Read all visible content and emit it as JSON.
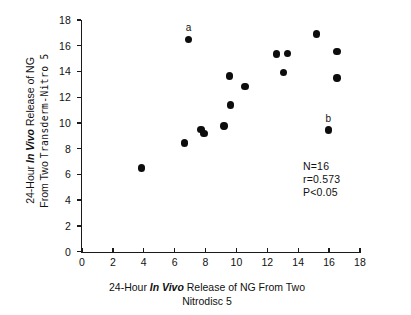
{
  "chart_data": {
    "type": "scatter",
    "title": "",
    "xlabel_line1_pre": "24-Hour ",
    "xlabel_line1_em": "In Vivo",
    "xlabel_line1_post": " Release of NG From Two",
    "xlabel_line2": "Nitrodisc 5",
    "ylabel_line1_pre": "24-Hour ",
    "ylabel_line1_em": "In Vivo",
    "ylabel_line1_post": " Release of NG",
    "ylabel_line2_pre": "From Two ",
    "ylabel_line2_mono": "Transderm-Nitro 5",
    "xlim": [
      0,
      18
    ],
    "ylim": [
      0,
      18
    ],
    "xticks": [
      0,
      2,
      4,
      6,
      8,
      10,
      12,
      14,
      16,
      18
    ],
    "yticks": [
      0,
      2,
      4,
      6,
      8,
      10,
      12,
      14,
      16,
      18
    ],
    "xtick_labels": [
      "0",
      "2",
      "4",
      "6",
      "8",
      "10",
      "12",
      "14",
      "16",
      "18"
    ],
    "ytick_labels": [
      "0",
      "2",
      "4",
      "6",
      "8",
      "10",
      "12",
      "14",
      "16",
      "18"
    ],
    "grid": false,
    "legend": false,
    "marker": "filled-circle",
    "marker_color": "#0d0d0d",
    "points": [
      {
        "x": 3.85,
        "y": 6.5,
        "label": ""
      },
      {
        "x": 6.65,
        "y": 8.45,
        "label": ""
      },
      {
        "x": 6.9,
        "y": 16.5,
        "label": "a"
      },
      {
        "x": 7.7,
        "y": 9.5,
        "label": ""
      },
      {
        "x": 7.9,
        "y": 9.2,
        "label": ""
      },
      {
        "x": 9.2,
        "y": 9.75,
        "label": ""
      },
      {
        "x": 9.55,
        "y": 13.65,
        "label": ""
      },
      {
        "x": 9.6,
        "y": 11.4,
        "label": ""
      },
      {
        "x": 10.55,
        "y": 12.85,
        "label": ""
      },
      {
        "x": 12.6,
        "y": 15.35,
        "label": ""
      },
      {
        "x": 13.05,
        "y": 13.9,
        "label": ""
      },
      {
        "x": 13.3,
        "y": 15.4,
        "label": ""
      },
      {
        "x": 15.2,
        "y": 16.9,
        "label": ""
      },
      {
        "x": 15.95,
        "y": 9.45,
        "label": "b"
      },
      {
        "x": 16.5,
        "y": 15.55,
        "label": ""
      },
      {
        "x": 16.5,
        "y": 13.5,
        "label": ""
      }
    ],
    "annotations": {
      "n": "N=16",
      "r": "r=0.573",
      "p": "P<0.05"
    }
  }
}
